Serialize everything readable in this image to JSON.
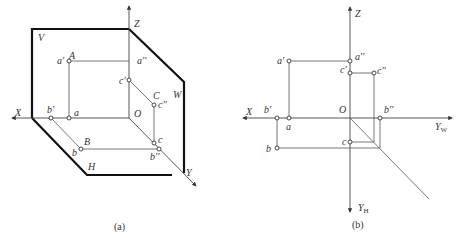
{
  "figure_a": {
    "caption": "(a)",
    "planes": {
      "v": "V",
      "w": "W",
      "h": "H"
    },
    "axes": {
      "x": "X",
      "y": "Y",
      "z": "Z",
      "origin": "O"
    },
    "points": {
      "A": "A",
      "a_prime": "a'",
      "a": "a",
      "a_dprime": "a''",
      "B": "B",
      "b_prime": "b'",
      "b": "b",
      "b_dprime": "b''",
      "C": "C",
      "c_prime": "c'",
      "c": "c",
      "c_dprime": "c''"
    }
  },
  "figure_b": {
    "caption": "(b)",
    "axes": {
      "x": "X",
      "z": "Z",
      "origin": "O",
      "yw": "Y",
      "yw_sub": "W",
      "yh": "Y",
      "yh_sub": "H"
    },
    "points": {
      "a_prime": "a'",
      "a": "a",
      "a_dprime": "a''",
      "b_prime": "b'",
      "b": "b",
      "b_dprime": "b''",
      "c_prime": "c'",
      "c": "c",
      "c_dprime": "c''"
    }
  }
}
